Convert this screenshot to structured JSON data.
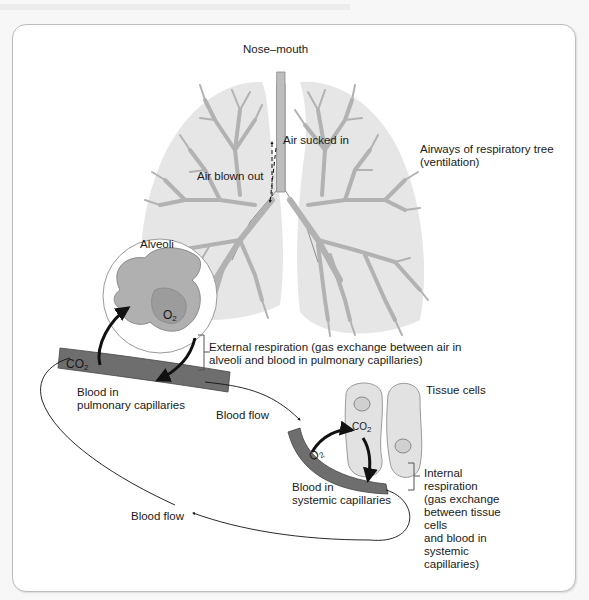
{
  "figure": {
    "type": "respiration-diagram",
    "labels": {
      "nose_mouth": "Nose–mouth",
      "air_sucked_in": "Air sucked in",
      "air_blown_out": "Air blown out",
      "airways_line1": "Airways of respiratory tree",
      "airways_line2": "(ventilation)",
      "alveoli": "Alveoli",
      "o2_alveoli": "O",
      "co2_pulmonary": "CO",
      "external_respiration_line1": "External respiration (gas exchange between air in",
      "external_respiration_line2": "alveoli and blood in pulmonary capillaries)",
      "blood_in_pulmonary_line1": "Blood in",
      "blood_in_pulmonary_line2": "pulmonary capillaries",
      "blood_flow_1": "Blood flow",
      "tissue_cells": "Tissue cells",
      "co2_tissue": "CO",
      "o2_systemic": "O",
      "blood_in_systemic_line1": "Blood in",
      "blood_in_systemic_line2": "systemic capillaries",
      "internal_respiration": [
        "Internal",
        "respiration",
        "(gas exchange",
        "between tissue",
        "cells",
        "and blood in",
        "systemic",
        "capillaries)"
      ],
      "blood_flow_2": "Blood flow",
      "subscript_2": "2"
    },
    "colors": {
      "lung_fill": "#e6e6e6",
      "airway_fill": "#b9b9b9",
      "capillary_fill": "#6e6e6e",
      "alveoli_fill": "#a9a9a9",
      "tissue_fill": "#e2e2e2",
      "frame_border": "#bdbdbd"
    }
  }
}
